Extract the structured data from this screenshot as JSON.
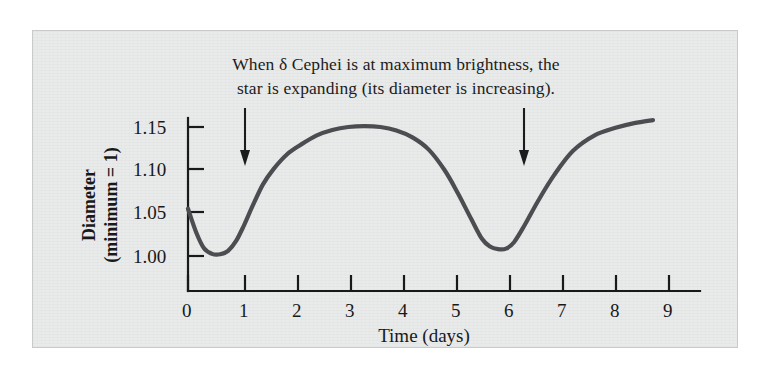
{
  "figure": {
    "caption_lines": [
      "When δ Cephei is at maximum brightness, the",
      "star is expanding (its diameter is increasing)."
    ],
    "panel_background": "#e9eaea",
    "ink_color": "#1a1b1c",
    "curve_color": "#4b4d50"
  },
  "chart_data": {
    "type": "line",
    "title": "",
    "xlabel": "Time (days)",
    "ylabel_lines": [
      "Diameter",
      "(minimum = 1)"
    ],
    "ylabel": "Diameter (minimum = 1)",
    "xlim": [
      0,
      9.5
    ],
    "ylim": [
      0.975,
      1.168
    ],
    "grid": false,
    "legend": null,
    "xticks": [
      0,
      1,
      2,
      3,
      4,
      5,
      6,
      7,
      8,
      9
    ],
    "xtick_labels": [
      "0",
      "1",
      "2",
      "3",
      "4",
      "5",
      "6",
      "7",
      "8",
      "9"
    ],
    "yticks": [
      1.0,
      1.05,
      1.1,
      1.15
    ],
    "ytick_labels": [
      "1.00",
      "1.05",
      "1.10",
      "1.15"
    ],
    "series": [
      {
        "name": "δ Cephei diameter",
        "color": "#4b4d50",
        "x": [
          0.0,
          0.15,
          0.3,
          0.45,
          0.6,
          0.75,
          0.9,
          1.05,
          1.2,
          1.4,
          1.6,
          1.85,
          2.1,
          2.4,
          2.7,
          3.0,
          3.3,
          3.6,
          3.9,
          4.2,
          4.5,
          4.8,
          5.05,
          5.3,
          5.5,
          5.65,
          5.8,
          5.95,
          6.1,
          6.3,
          6.55,
          6.85,
          7.2,
          7.6,
          8.0,
          8.35,
          8.7
        ],
        "y": [
          1.055,
          1.028,
          1.009,
          1.0025,
          1.002,
          1.006,
          1.0175,
          1.036,
          1.057,
          1.083,
          1.101,
          1.118,
          1.129,
          1.14,
          1.1465,
          1.15,
          1.151,
          1.15,
          1.146,
          1.138,
          1.124,
          1.1,
          1.073,
          1.043,
          1.02,
          1.011,
          1.008,
          1.0085,
          1.016,
          1.036,
          1.064,
          1.094,
          1.122,
          1.14,
          1.149,
          1.1545,
          1.158
        ]
      }
    ],
    "annotations": [
      {
        "name": "arrow-max-brightness-left",
        "type": "down-arrow",
        "x": 1.05,
        "y_top": 1.168,
        "y_tip": 1.107
      },
      {
        "name": "arrow-max-brightness-right",
        "type": "down-arrow",
        "x": 6.25,
        "y_top": 1.168,
        "y_tip": 1.107
      }
    ]
  }
}
